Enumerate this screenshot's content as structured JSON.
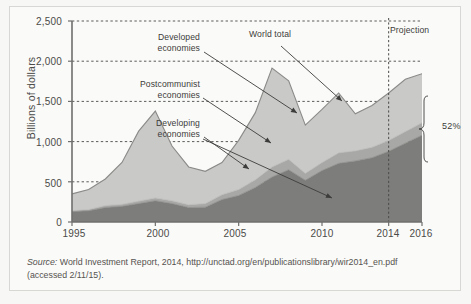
{
  "figure": {
    "axis_title_y": "Billions of dollars",
    "projection_label": "Projection",
    "bracket_label": "52%",
    "source_prefix": "Source:",
    "source_text": " World Investment Report, 2014, http://unctad.org/en/publicationslibrary/wir2014_en.pdf",
    "source_accessed": "(accessed 2/11/15).",
    "annotations": [
      {
        "id": "developed",
        "line1": "Developed",
        "line2": "economies"
      },
      {
        "id": "postcommunist",
        "line1": "Postcommunist",
        "line2": "economies"
      },
      {
        "id": "developing",
        "line1": "Developing",
        "line2": "economies"
      },
      {
        "id": "world-total",
        "line1": "World total",
        "line2": ""
      }
    ],
    "colors": {
      "page": "#f7f7f5",
      "panel": "#fafaf8",
      "frame": "#d7d7d4",
      "developing": "#7d7d7b",
      "postcommunist": "#a8a8a6",
      "developed": "#c9c9c7",
      "outline": "#8a8a88",
      "gridline": "#4a4a48",
      "text": "#3c3c3a"
    }
  },
  "chart_data": {
    "type": "area",
    "title": "",
    "xlabel": "",
    "ylabel": "Billions of dollars",
    "xlim": [
      1995,
      2016
    ],
    "ylim": [
      0,
      2500
    ],
    "ytick_labels": [
      "0",
      "500",
      "1,000",
      "1,500",
      "2,000",
      "2,500"
    ],
    "ytick_values": [
      0,
      500,
      1000,
      1500,
      2000,
      2500
    ],
    "xtick_labels": [
      "1995",
      "2000",
      "2005",
      "2010",
      "2014",
      "2016"
    ],
    "xtick_values": [
      1995,
      2000,
      2005,
      2010,
      2014,
      2016
    ],
    "grid": true,
    "legend": "annotations",
    "projection_start_year": 2014,
    "x": [
      1995,
      1996,
      1997,
      1998,
      1999,
      2000,
      2001,
      2002,
      2003,
      2004,
      2005,
      2006,
      2007,
      2008,
      2009,
      2010,
      2011,
      2012,
      2013,
      2014,
      2015,
      2016
    ],
    "series": [
      {
        "name": "Developing economies",
        "stack_order": 1,
        "values": [
          130,
          140,
          180,
          195,
          230,
          265,
          230,
          180,
          185,
          280,
          330,
          430,
          560,
          650,
          520,
          640,
          730,
          760,
          800,
          880,
          980,
          1080
        ]
      },
      {
        "name": "Postcommunist economies",
        "stack_order": 2,
        "values": [
          10,
          15,
          25,
          25,
          30,
          35,
          35,
          35,
          45,
          60,
          75,
          95,
          125,
          130,
          85,
          100,
          130,
          125,
          130,
          135,
          145,
          155
        ]
      },
      {
        "name": "Developed economies",
        "stack_order": 3,
        "values": [
          210,
          250,
          330,
          520,
          870,
          1080,
          680,
          470,
          400,
          400,
          610,
          835,
          1230,
          975,
          600,
          660,
          745,
          460,
          520,
          590,
          650,
          610
        ]
      },
      {
        "name": "World total",
        "stack_order": 0,
        "values": [
          350,
          405,
          535,
          740,
          1130,
          1380,
          945,
          685,
          630,
          740,
          1015,
          1360,
          1915,
          1755,
          1205,
          1400,
          1605,
          1345,
          1450,
          1605,
          1775,
          1845
        ]
      }
    ],
    "annotation_percent": 52
  }
}
